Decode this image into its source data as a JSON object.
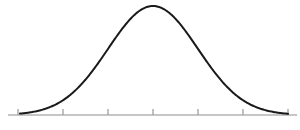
{
  "figure": {
    "title": "",
    "background_color": "#ffffff",
    "width": 300,
    "height": 130
  },
  "chart_data": {
    "type": "line",
    "title": "",
    "subtitle": "",
    "xlabel": "",
    "ylabel": "",
    "legend": [],
    "legend_position": "none",
    "grid": false,
    "annotations": [],
    "curve": {
      "name": "normal-distribution",
      "distribution": "gaussian",
      "mean": 0,
      "std_dev": 1,
      "color": "#1a1a1a",
      "line_width": 2,
      "fill": "none",
      "peak_x": 0,
      "peak_y": 1,
      "x": [
        -3,
        -2.75,
        -2.5,
        -2.25,
        -2,
        -1.75,
        -1.5,
        -1.25,
        -1,
        -0.75,
        -0.5,
        -0.25,
        0,
        0.25,
        0.5,
        0.75,
        1,
        1.25,
        1.5,
        1.75,
        2,
        2.25,
        2.5,
        2.75,
        3
      ],
      "y": [
        0.011,
        0.022,
        0.044,
        0.079,
        0.135,
        0.216,
        0.325,
        0.458,
        0.607,
        0.755,
        0.882,
        0.969,
        1.0,
        0.969,
        0.882,
        0.755,
        0.607,
        0.458,
        0.325,
        0.216,
        0.135,
        0.079,
        0.044,
        0.022,
        0.011
      ],
      "xlim": [
        -3,
        3
      ],
      "ylim": [
        0,
        1
      ]
    },
    "axis": {
      "color": "#b3b3b3",
      "line_width": 1.4,
      "baseline_y_px": 115,
      "x_start_px": 8,
      "x_end_px": 297,
      "tick_color": "#9e9e9e",
      "tick_length_px": 6,
      "tick_count": 7,
      "tick_positions_px": [
        18,
        63,
        108,
        153,
        198,
        243,
        288
      ],
      "tick_values": [
        -3,
        -2,
        -1,
        0,
        1,
        2,
        3
      ],
      "tick_labels": [
        "",
        "",
        "",
        "",
        "",
        "",
        ""
      ],
      "spacing_px": 45
    },
    "pixel_mapping": {
      "center_x_px": 153,
      "baseline_y_px": 115,
      "amplitude_px": 109,
      "sigma_px": 45
    }
  }
}
